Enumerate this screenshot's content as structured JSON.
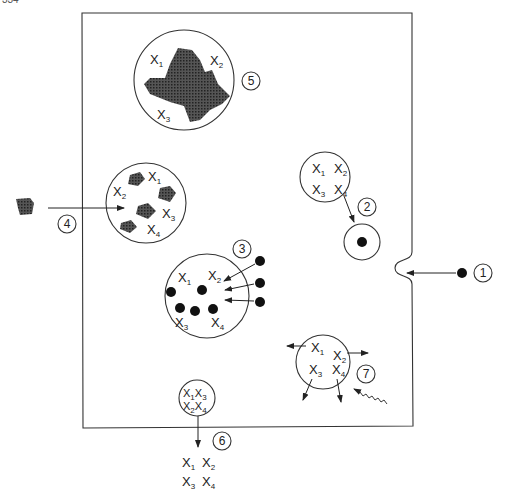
{
  "page_number": "334",
  "diagram": {
    "type": "cell-processes",
    "cell_boundary": "plasma membrane",
    "processes": [
      {
        "id": "1",
        "label": "1",
        "description": "particle entering via membrane invagination"
      },
      {
        "id": "2",
        "label": "2",
        "description": "vesicle with X1-X4 fusing with particle vesicle",
        "contents": [
          "X1",
          "X2",
          "X3",
          "X4"
        ]
      },
      {
        "id": "3",
        "label": "3",
        "description": "particles taken into vesicle",
        "contents": [
          "X1",
          "X2",
          "X3",
          "X4"
        ]
      },
      {
        "id": "4",
        "label": "4",
        "description": "irregular material enters vesicle",
        "contents": [
          "X1",
          "X2",
          "X3",
          "X4"
        ]
      },
      {
        "id": "5",
        "label": "5",
        "description": "large irregular mass in vesicle",
        "contents": [
          "X1",
          "X2",
          "X3"
        ]
      },
      {
        "id": "6",
        "label": "6",
        "description": "exocytosis releasing contents",
        "contents": [
          "X1",
          "X3",
          "X2",
          "X4"
        ],
        "released": [
          "X1",
          "X2",
          "X3",
          "X4"
        ]
      },
      {
        "id": "7",
        "label": "7",
        "description": "vesicle rupture by radiation",
        "contents": [
          "X1",
          "X2",
          "X3",
          "X4"
        ]
      }
    ]
  },
  "colors": {
    "line": "#333333",
    "fill_dark": "#444444",
    "background": "#ffffff"
  }
}
